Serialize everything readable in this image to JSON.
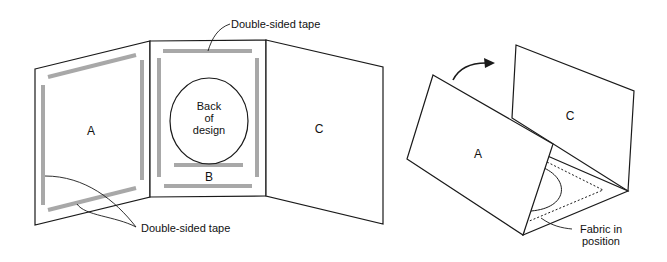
{
  "figure": {
    "left_view": {
      "panel_a_label": "A",
      "panel_b_label": "B",
      "panel_c_label": "C",
      "oval_text": [
        "Back",
        "of",
        "design"
      ],
      "callout_top": "Double-sided tape",
      "callout_bottom": "Double-sided tape"
    },
    "right_view": {
      "panel_a_label": "A",
      "panel_c_label": "C",
      "callout_fabric": [
        "Fabric in",
        "position"
      ]
    },
    "colors": {
      "tape": "#a8a8a8",
      "line": "#1a1a1a",
      "background": "#ffffff"
    }
  }
}
